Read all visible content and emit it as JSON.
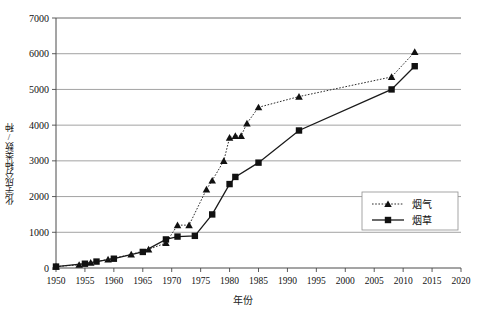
{
  "chart_data": {
    "type": "line",
    "title": "",
    "xlabel": "年份",
    "ylabel": "化学成分种类数/种",
    "xlim": [
      1950,
      2020
    ],
    "ylim": [
      0,
      7000
    ],
    "xticks": [
      1950,
      1955,
      1960,
      1965,
      1970,
      1975,
      1980,
      1985,
      1990,
      1995,
      2000,
      2005,
      2010,
      2015,
      2020
    ],
    "yticks": [
      0,
      1000,
      2000,
      3000,
      4000,
      5000,
      6000,
      7000
    ],
    "grid": "horizontal",
    "legend_position": "right-middle",
    "series": [
      {
        "name": "烟气",
        "marker": "triangle",
        "linestyle": "dotted",
        "color": "#111111",
        "points": [
          [
            1950,
            40
          ],
          [
            1954,
            90
          ],
          [
            1956,
            150
          ],
          [
            1959,
            240
          ],
          [
            1963,
            380
          ],
          [
            1966,
            520
          ],
          [
            1969,
            700
          ],
          [
            1971,
            1200
          ],
          [
            1973,
            1200
          ],
          [
            1976,
            2200
          ],
          [
            1977,
            2450
          ],
          [
            1979,
            3000
          ],
          [
            1980,
            3650
          ],
          [
            1981,
            3700
          ],
          [
            1982,
            3700
          ],
          [
            1983,
            4050
          ],
          [
            1985,
            4500
          ],
          [
            1992,
            4800
          ],
          [
            2008,
            5350
          ],
          [
            2012,
            6050
          ]
        ]
      },
      {
        "name": "烟草",
        "marker": "square",
        "linestyle": "solid",
        "color": "#111111",
        "points": [
          [
            1950,
            40
          ],
          [
            1955,
            120
          ],
          [
            1957,
            180
          ],
          [
            1960,
            260
          ],
          [
            1965,
            450
          ],
          [
            1969,
            800
          ],
          [
            1971,
            880
          ],
          [
            1974,
            900
          ],
          [
            1977,
            1500
          ],
          [
            1980,
            2350
          ],
          [
            1981,
            2550
          ],
          [
            1985,
            2950
          ],
          [
            1992,
            3850
          ],
          [
            2008,
            5000
          ],
          [
            2012,
            5650
          ]
        ]
      }
    ]
  },
  "legend": {
    "items": [
      {
        "label": "烟气"
      },
      {
        "label": "烟草"
      }
    ]
  },
  "axes": {
    "y_title": "化学成分种类数/种",
    "x_title": "年份"
  }
}
